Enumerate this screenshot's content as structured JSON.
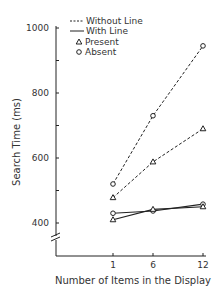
{
  "chart_data": {
    "type": "line",
    "title": "",
    "xlabel": "Number of Items in the Display",
    "ylabel": "Search Time (ms)",
    "x": [
      1,
      6,
      12
    ],
    "x_tick_labels": [
      "1",
      "6",
      "12"
    ],
    "y_tick_labels": [
      "400",
      "600",
      "800",
      "1000"
    ],
    "y_ticks": [
      400,
      500,
      600,
      700,
      800,
      900,
      1000
    ],
    "ylim": [
      300,
      1000
    ],
    "y_axis_break": true,
    "grid": false,
    "legend_position": "top-left",
    "legend": {
      "line_styles": [
        {
          "label": "Without Line",
          "style": "dashed"
        },
        {
          "label": "With Line",
          "style": "solid"
        }
      ],
      "markers": [
        {
          "label": "Present",
          "marker": "triangle"
        },
        {
          "label": "Absent",
          "marker": "circle"
        }
      ]
    },
    "series": [
      {
        "name": "Without Line - Absent",
        "style": "dashed",
        "marker": "circle",
        "values": [
          520,
          730,
          945
        ]
      },
      {
        "name": "Without Line - Present",
        "style": "dashed",
        "marker": "triangle",
        "values": [
          478,
          588,
          690
        ]
      },
      {
        "name": "With Line - Absent",
        "style": "solid",
        "marker": "circle",
        "values": [
          430,
          437,
          458
        ]
      },
      {
        "name": "With Line - Present",
        "style": "solid",
        "marker": "triangle",
        "values": [
          410,
          442,
          450
        ]
      }
    ]
  }
}
